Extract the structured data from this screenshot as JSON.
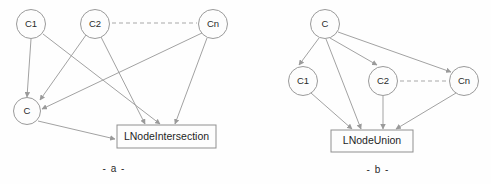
{
  "figure": {
    "background_color": "#fefefe",
    "node_stroke_color": "#9a9a9a",
    "edge_color": "#a2a2a2",
    "text_color": "#2a2a2a"
  },
  "panels": [
    {
      "id": "a",
      "caption": "- a -",
      "caption_x": 114,
      "caption_y": 169,
      "nodes": [
        {
          "id": "a-c1",
          "label": "C1",
          "cx": 31,
          "cy": 24,
          "r": 14.5
        },
        {
          "id": "a-c2",
          "label": "C2",
          "cx": 95,
          "cy": 24,
          "r": 14.5
        },
        {
          "id": "a-cn",
          "label": "Cn",
          "cx": 213,
          "cy": 24,
          "r": 14.5
        },
        {
          "id": "a-c",
          "label": "C",
          "cx": 27,
          "cy": 111,
          "r": 13.5
        }
      ],
      "box": {
        "id": "a-box",
        "label": "LNodeIntersection",
        "x": 117,
        "y": 125,
        "width": 99,
        "height": 23
      },
      "dashed_connector": {
        "x1": 112,
        "y1": 23,
        "x2": 197,
        "y2": 23
      },
      "edges": [
        {
          "from": "C1",
          "to": "C",
          "x1": 31,
          "y1": 39,
          "x2": 27,
          "y2": 97
        },
        {
          "from": "C1",
          "to": "LNodeIntersection",
          "x1": 43,
          "y1": 34,
          "x2": 160,
          "y2": 124
        },
        {
          "from": "C2",
          "to": "C",
          "x1": 86,
          "y1": 35,
          "x2": 40,
          "y2": 100
        },
        {
          "from": "C2",
          "to": "LNodeIntersection",
          "x1": 101,
          "y1": 37,
          "x2": 145,
          "y2": 124
        },
        {
          "from": "Cn",
          "to": "C",
          "x1": 202,
          "y1": 33,
          "x2": 42,
          "y2": 109
        },
        {
          "from": "Cn",
          "to": "LNodeIntersection",
          "x1": 207,
          "y1": 38,
          "x2": 175,
          "y2": 124
        },
        {
          "from": "C",
          "to": "LNodeIntersection",
          "x1": 38,
          "y1": 121,
          "x2": 115,
          "y2": 139
        }
      ]
    },
    {
      "id": "b",
      "caption": "- b -",
      "caption_x": 378,
      "caption_y": 170,
      "nodes": [
        {
          "id": "b-c",
          "label": "C",
          "cx": 325,
          "cy": 24,
          "r": 14.5
        },
        {
          "id": "b-c1",
          "label": "C1",
          "cx": 303,
          "cy": 81,
          "r": 14.5
        },
        {
          "id": "b-c2",
          "label": "C2",
          "cx": 383,
          "cy": 81,
          "r": 14.5
        },
        {
          "id": "b-cn",
          "label": "Cn",
          "cx": 464,
          "cy": 81,
          "r": 14.5
        }
      ],
      "box": {
        "id": "b-box",
        "label": "LNodeUnion",
        "x": 331,
        "y": 130,
        "width": 82,
        "height": 22
      },
      "dashed_connector": {
        "x1": 400,
        "y1": 81,
        "x2": 448,
        "y2": 81
      },
      "edges": [
        {
          "from": "C",
          "to": "C1",
          "x1": 319,
          "y1": 38,
          "x2": 299,
          "y2": 65
        },
        {
          "from": "C",
          "to": "C2",
          "x1": 330,
          "y1": 38,
          "x2": 377,
          "y2": 65
        },
        {
          "from": "C",
          "to": "Cn",
          "x1": 338,
          "y1": 32,
          "x2": 451,
          "y2": 72
        },
        {
          "from": "C",
          "to": "LNodeUnion",
          "x1": 326,
          "y1": 39,
          "x2": 361,
          "y2": 129
        },
        {
          "from": "C1",
          "to": "LNodeUnion",
          "x1": 311,
          "y1": 93,
          "x2": 352,
          "y2": 129
        },
        {
          "from": "C2",
          "to": "LNodeUnion",
          "x1": 383,
          "y1": 96,
          "x2": 383,
          "y2": 129
        },
        {
          "from": "Cn",
          "to": "LNodeUnion",
          "x1": 456,
          "y1": 93,
          "x2": 396,
          "y2": 129
        }
      ]
    }
  ]
}
